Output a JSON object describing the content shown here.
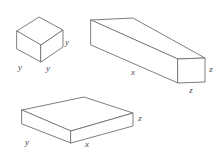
{
  "figure": {
    "background_color": "#ffffff",
    "stroke_color": "#6f6f6f",
    "label_color": "#4a4a4a",
    "solids": [
      {
        "id": "cube",
        "name": "cube",
        "labels": [
          {
            "id": "cube-right-y",
            "text": "y",
            "x": 67,
            "y": 43
          },
          {
            "id": "cube-front-left-y",
            "text": "y",
            "x": 20,
            "y": 68
          },
          {
            "id": "cube-front-right-y",
            "text": "y",
            "x": 48,
            "y": 69
          }
        ]
      },
      {
        "id": "long-prism",
        "name": "long rectangular prism",
        "labels": [
          {
            "id": "prism-length-x",
            "text": "x",
            "x": 133,
            "y": 73
          },
          {
            "id": "prism-height-z",
            "text": "z",
            "x": 211,
            "y": 70
          },
          {
            "id": "prism-depth-z",
            "text": "z",
            "x": 191,
            "y": 91
          }
        ]
      },
      {
        "id": "slab",
        "name": "flat rectangular slab",
        "labels": [
          {
            "id": "slab-depth-y",
            "text": "y",
            "x": 27,
            "y": 143
          },
          {
            "id": "slab-length-x",
            "text": "x",
            "x": 87,
            "y": 145
          },
          {
            "id": "slab-height-z",
            "text": "z",
            "x": 140,
            "y": 119
          }
        ]
      }
    ]
  }
}
